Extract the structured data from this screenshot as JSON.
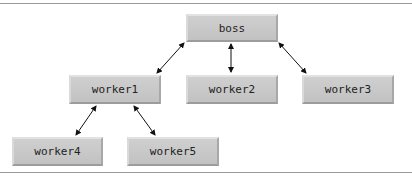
{
  "diagram": {
    "type": "hierarchy",
    "nodes": [
      {
        "id": "boss",
        "label": "boss"
      },
      {
        "id": "worker1",
        "label": "worker1"
      },
      {
        "id": "worker2",
        "label": "worker2"
      },
      {
        "id": "worker3",
        "label": "worker3"
      },
      {
        "id": "worker4",
        "label": "worker4"
      },
      {
        "id": "worker5",
        "label": "worker5"
      }
    ],
    "edges": [
      {
        "from": "boss",
        "to": "worker1",
        "bidirectional": true
      },
      {
        "from": "boss",
        "to": "worker2",
        "bidirectional": true
      },
      {
        "from": "boss",
        "to": "worker3",
        "bidirectional": true
      },
      {
        "from": "worker1",
        "to": "worker4",
        "bidirectional": true
      },
      {
        "from": "worker1",
        "to": "worker5",
        "bidirectional": true
      }
    ],
    "colors": {
      "node_fill": "#c8c8c8",
      "arrow": "#111111",
      "rule": "#9a9a9a"
    }
  }
}
